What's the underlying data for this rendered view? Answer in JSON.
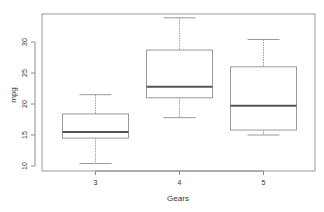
{
  "chart_data": {
    "type": "box",
    "title": "",
    "xlabel": "Gears",
    "ylabel": "mpg",
    "ylim": [
      9.2,
      35.2
    ],
    "yticks": [
      10,
      15,
      20,
      25,
      30
    ],
    "categories": [
      "3",
      "4",
      "5"
    ],
    "boxes": [
      {
        "category": "3",
        "min": 10.4,
        "q1": 14.5,
        "median": 15.5,
        "q3": 18.4,
        "max": 21.5
      },
      {
        "category": "4",
        "min": 17.8,
        "q1": 21.0,
        "median": 22.8,
        "q3": 28.7,
        "max": 33.9
      },
      {
        "category": "5",
        "min": 15.0,
        "q1": 15.8,
        "median": 19.7,
        "q3": 26.0,
        "max": 30.4
      }
    ],
    "grid": false,
    "legend": null
  },
  "colors": {
    "axis": "#8c8c8c",
    "box": "#999999",
    "median": "#555555",
    "whisker": "#a0a0a0",
    "text": "#333333"
  }
}
